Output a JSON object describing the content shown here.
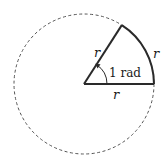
{
  "diagram": {
    "title": "",
    "circle": {
      "center": [
        84,
        84
      ],
      "radius": 70,
      "style": "dashed",
      "color": "#555555"
    },
    "sector": {
      "angle_rad": 1,
      "stroke": "#2a2a2a"
    },
    "labels": {
      "radius_top": "r",
      "arc": "r",
      "radius_bottom": "r",
      "angle": "1 rad"
    }
  }
}
